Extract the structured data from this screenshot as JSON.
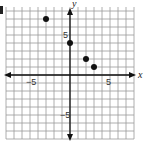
{
  "chart_data": {
    "type": "scatter",
    "title": "",
    "xlabel": "x",
    "ylabel": "y",
    "xlim": [
      -8,
      8
    ],
    "ylim": [
      -8,
      8.5
    ],
    "grid": true,
    "grid_step": 1,
    "x_tick_labels": [
      {
        "value": -5,
        "label": "−5"
      },
      {
        "value": 5,
        "label": "5"
      }
    ],
    "y_tick_labels": [
      {
        "value": 5,
        "label": "5"
      },
      {
        "value": -5,
        "label": "−5"
      }
    ],
    "series": [
      {
        "name": "points",
        "points": [
          [
            -3,
            7
          ],
          [
            0,
            4
          ],
          [
            2,
            2
          ],
          [
            3,
            1
          ]
        ]
      }
    ],
    "point_color": "#111111",
    "grid_color": "#9a9a9a",
    "axis_color": "#111111"
  }
}
